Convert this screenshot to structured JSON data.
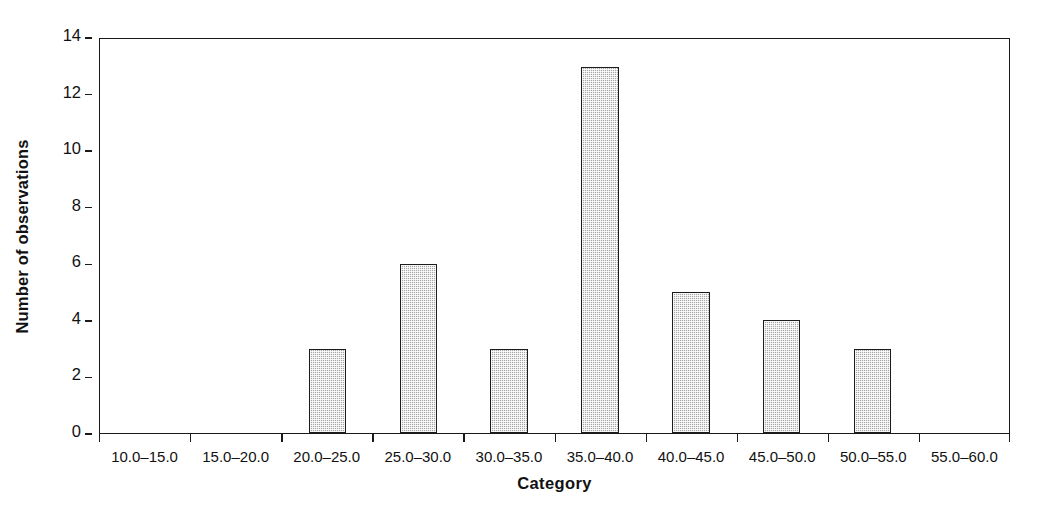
{
  "chart_data": {
    "type": "bar",
    "title": "",
    "subtitle": "",
    "xlabel": "Category",
    "ylabel": "Number of observations",
    "categories": [
      "10.0–15.0",
      "15.0–20.0",
      "20.0–25.0",
      "25.0–30.0",
      "30.0–35.0",
      "35.0–40.0",
      "40.0–45.0",
      "45.0–50.0",
      "50.0–55.0",
      "55.0–60.0"
    ],
    "values": [
      0,
      0,
      3,
      6,
      3,
      13,
      5,
      4,
      3,
      0
    ],
    "ylim": [
      0,
      14
    ],
    "ytick_values": [
      0,
      2,
      4,
      6,
      8,
      10,
      12,
      14
    ],
    "ytick_labels": [
      "0",
      "2",
      "4",
      "6",
      "8",
      "10",
      "12",
      "14"
    ],
    "grid": false,
    "legend": null,
    "bar_fill_color": "#a6a6a6",
    "bar_edge_color": "#1c1c1c",
    "axis_color": "#1a1a1a",
    "background_color": "#ffffff"
  }
}
